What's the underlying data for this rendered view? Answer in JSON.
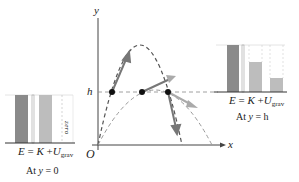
{
  "diagram": {
    "axes": {
      "x_label": "x",
      "y_label": "y",
      "origin_label": "O",
      "h_label": "h"
    },
    "left_chart": {
      "equation": {
        "E": "E",
        "eq": "=",
        "K": "K",
        "plus": "+",
        "U": "U",
        "U_sub": "grav"
      },
      "caption_prefix": "At ",
      "caption_var": "y",
      "caption_value": " = 0",
      "zero_label": "zero",
      "bars": [
        {
          "name": "E",
          "height": 1.0,
          "color": "#8a8a8a"
        },
        {
          "name": "K",
          "height": 1.0,
          "color": "#bdbdbd"
        },
        {
          "name": "U_grav",
          "height": 0.0,
          "color": "#d8d8d8"
        }
      ]
    },
    "right_chart": {
      "equation": {
        "E": "E",
        "eq": "=",
        "K": "K",
        "plus": "+",
        "U": "U",
        "U_sub": "grav"
      },
      "caption_prefix": "At ",
      "caption_var": "y",
      "caption_value": " = h",
      "bars": [
        {
          "name": "E",
          "height": 1.0,
          "color": "#8a8a8a"
        },
        {
          "name": "K",
          "height": 0.62,
          "color": "#bdbdbd"
        },
        {
          "name": "U_grav",
          "height": 0.3,
          "color": "#bdbdbd"
        }
      ]
    },
    "colors": {
      "axis": "#333333",
      "curve": "#555555",
      "vector": "#777777",
      "dot": "#111111"
    }
  }
}
